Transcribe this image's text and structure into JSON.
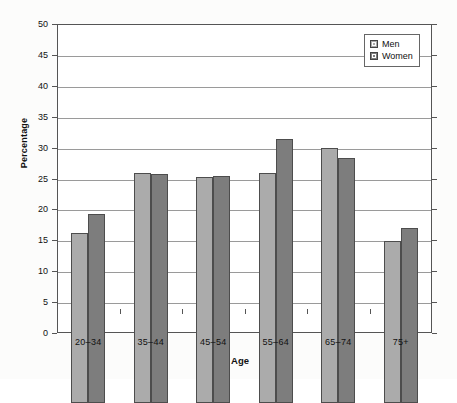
{
  "chart_data": {
    "type": "bar",
    "title": "",
    "xlabel": "Age",
    "ylabel": "Percentage",
    "categories": [
      "20–34",
      "35–44",
      "45–54",
      "55–64",
      "65–74",
      "75+"
    ],
    "series": [
      {
        "name": "Men",
        "color": "#ababab",
        "values": [
          27.5,
          37.2,
          36.5,
          37.2,
          41.2,
          26.2
        ]
      },
      {
        "name": "Women",
        "color": "#7d7d7d",
        "values": [
          30.6,
          37.1,
          36.7,
          42.8,
          39.7,
          28.4
        ]
      }
    ],
    "ylim": [
      0,
      50
    ],
    "ytick_values": [
      0,
      5,
      10,
      15,
      20,
      25,
      30,
      35,
      40,
      45,
      50
    ],
    "ytick_labels": [
      "0",
      "5",
      "10",
      "15",
      "20",
      "25",
      "30",
      "35",
      "40",
      "45",
      "50"
    ],
    "grid": true,
    "legend_position": "top-right"
  },
  "legend": {
    "entries": [
      {
        "label": "Men"
      },
      {
        "label": "Women"
      }
    ]
  }
}
